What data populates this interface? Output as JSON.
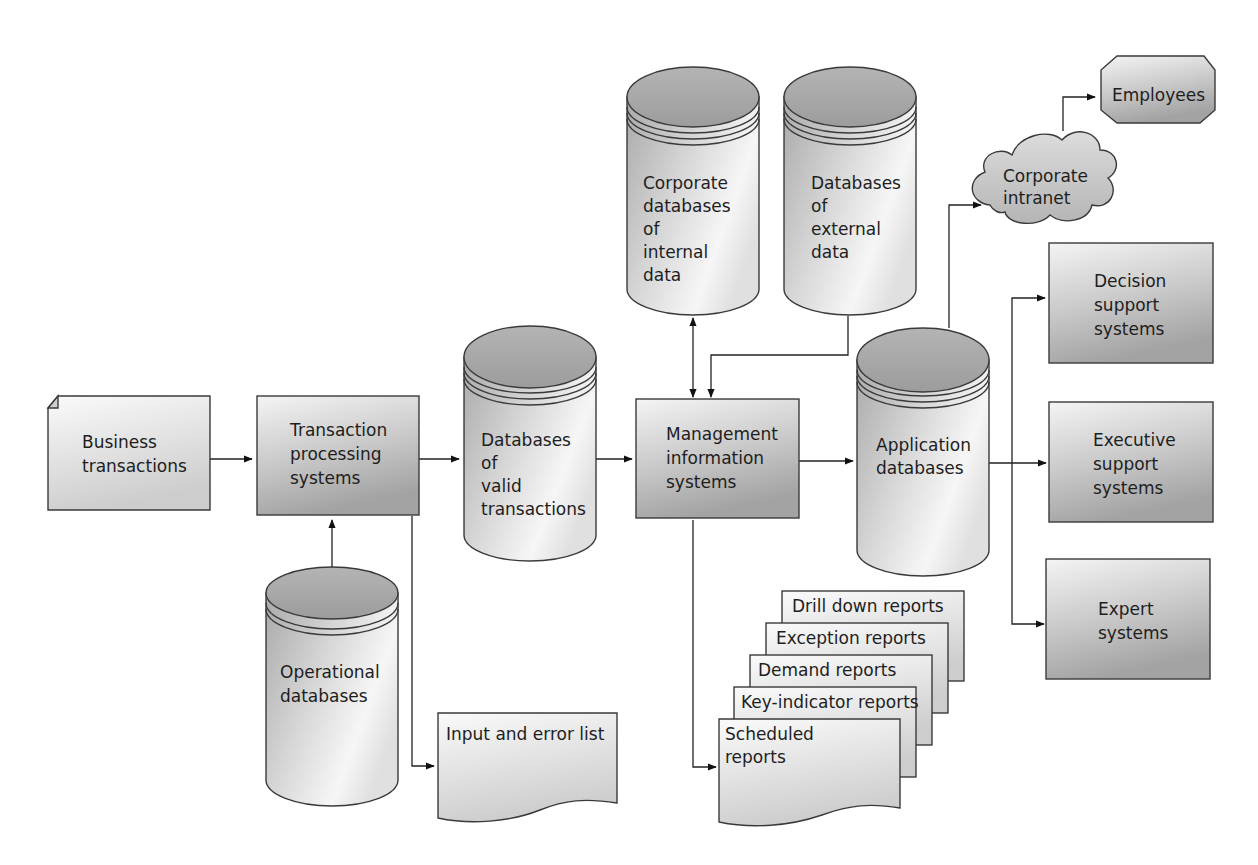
{
  "diagram": {
    "title": "",
    "nodes": {
      "business_transactions": {
        "lines": [
          "Business",
          "transactions"
        ],
        "shape": "document-folded"
      },
      "tps": {
        "lines": [
          "Transaction",
          "processing",
          "systems"
        ],
        "shape": "rectangle"
      },
      "operational_db": {
        "lines": [
          "Operational",
          "databases"
        ],
        "shape": "cylinder"
      },
      "input_error_list": {
        "lines": [
          "Input and error list"
        ],
        "shape": "document-wavy"
      },
      "valid_tx_db": {
        "lines": [
          "Databases",
          "of",
          "valid",
          "transactions"
        ],
        "shape": "cylinder"
      },
      "mis": {
        "lines": [
          "Management",
          "information",
          "systems"
        ],
        "shape": "rectangle"
      },
      "internal_db": {
        "lines": [
          "Corporate",
          "databases",
          "of",
          "internal",
          "data"
        ],
        "shape": "cylinder"
      },
      "external_db": {
        "lines": [
          "Databases",
          "of",
          "external",
          "data"
        ],
        "shape": "cylinder"
      },
      "app_db": {
        "lines": [
          "Application",
          "databases"
        ],
        "shape": "cylinder"
      },
      "intranet": {
        "lines": [
          "Corporate",
          "intranet"
        ],
        "shape": "cloud"
      },
      "employees": {
        "lines": [
          "Employees"
        ],
        "shape": "octagon"
      },
      "dss": {
        "lines": [
          "Decision",
          "support",
          "systems"
        ],
        "shape": "rectangle"
      },
      "ess": {
        "lines": [
          "Executive",
          "support",
          "systems"
        ],
        "shape": "rectangle"
      },
      "es": {
        "lines": [
          "Expert",
          "systems"
        ],
        "shape": "rectangle"
      },
      "reports": {
        "shape": "document-stack",
        "items": [
          {
            "lines": [
              "Drill down reports"
            ]
          },
          {
            "lines": [
              "Exception reports"
            ]
          },
          {
            "lines": [
              "Demand reports"
            ]
          },
          {
            "lines": [
              "Key-indicator reports"
            ]
          },
          {
            "lines": [
              "Scheduled",
              "reports"
            ]
          }
        ]
      }
    },
    "edges": [
      {
        "from": "business_transactions",
        "to": "tps",
        "type": "directed"
      },
      {
        "from": "tps",
        "to": "operational_db",
        "type": "bidirectional"
      },
      {
        "from": "tps",
        "to": "input_error_list",
        "type": "directed"
      },
      {
        "from": "tps",
        "to": "valid_tx_db",
        "type": "directed"
      },
      {
        "from": "valid_tx_db",
        "to": "mis",
        "type": "directed"
      },
      {
        "from": "mis",
        "to": "internal_db",
        "type": "bidirectional"
      },
      {
        "from": "external_db",
        "to": "mis",
        "type": "directed"
      },
      {
        "from": "mis",
        "to": "app_db",
        "type": "directed"
      },
      {
        "from": "mis",
        "to": "reports",
        "type": "directed"
      },
      {
        "from": "app_db",
        "to": "intranet",
        "type": "directed"
      },
      {
        "from": "intranet",
        "to": "employees",
        "type": "directed"
      },
      {
        "from": "app_db",
        "to": "dss",
        "type": "directed"
      },
      {
        "from": "app_db",
        "to": "ess",
        "type": "directed"
      },
      {
        "from": "app_db",
        "to": "es",
        "type": "directed"
      }
    ],
    "colors": {
      "shape_dark": "#9a9a9a",
      "shape_light": "#f2f2f2",
      "cylinder_top": "#a8a8a8",
      "line": "#222222",
      "text": "#1e1e1e"
    }
  }
}
